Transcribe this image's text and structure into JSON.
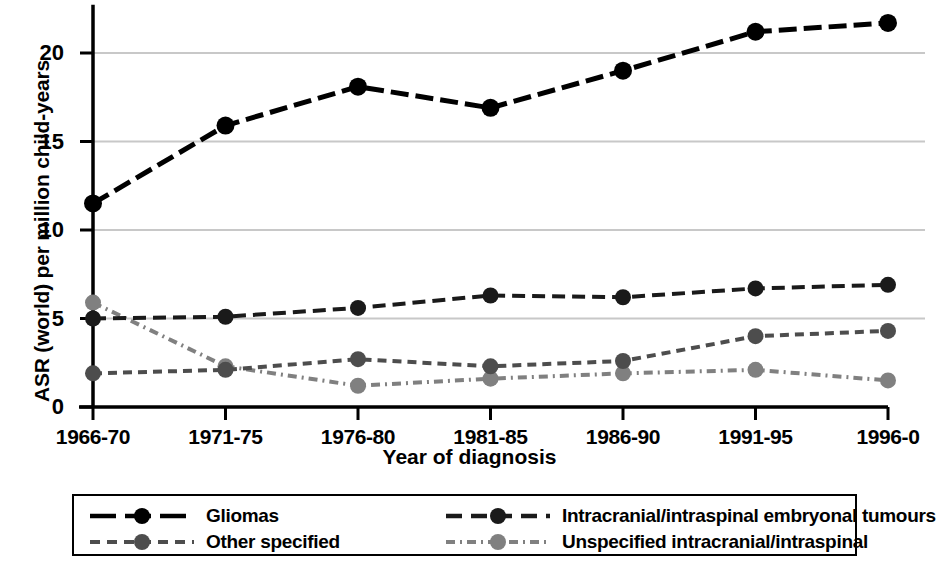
{
  "chart_data": {
    "type": "line",
    "title": "",
    "xlabel": "Year of diagnosis",
    "ylabel": "ASR (world) per million child-years",
    "categories": [
      "1966-70",
      "1971-75",
      "1976-80",
      "1981-85",
      "1986-90",
      "1991-95",
      "1996-0"
    ],
    "ylim": [
      0,
      22.5
    ],
    "yticks": [
      0,
      5,
      10,
      15,
      20
    ],
    "ytick_labels": [
      "0",
      "5",
      "10",
      "15",
      "20"
    ],
    "grid": "horizontal",
    "legend_position": "below-axes",
    "series": [
      {
        "name": "Gliomas",
        "values": [
          11.5,
          15.9,
          18.1,
          16.9,
          19.0,
          21.2,
          21.7
        ],
        "color": "#000000",
        "dash": "18,7",
        "marker": "circle",
        "marker_color": "#000000"
      },
      {
        "name": "Intracranial/intraspinal embryonal tumours",
        "values": [
          5.0,
          5.1,
          5.6,
          6.3,
          6.2,
          6.7,
          6.9
        ],
        "color": "#1a1a1a",
        "dash": "13,7",
        "marker": "circle",
        "marker_color": "#1a1a1a"
      },
      {
        "name": "Other specified",
        "values": [
          1.9,
          2.1,
          2.7,
          2.3,
          2.6,
          4.0,
          4.3
        ],
        "color": "#4d4d4d",
        "dash": "9,6",
        "marker": "circle",
        "marker_color": "#4d4d4d"
      },
      {
        "name": "Unspecified intracranial/intraspinal",
        "values": [
          5.9,
          2.3,
          1.2,
          1.6,
          1.9,
          2.1,
          1.5
        ],
        "color": "#808080",
        "dash": "9,5,2,5",
        "marker": "circle",
        "marker_color": "#808080"
      }
    ]
  },
  "axis": {
    "x_title": "Year of diagnosis",
    "y_title": "ASR (world) per million child-years"
  },
  "legend": {
    "entries": [
      {
        "label": "Gliomas"
      },
      {
        "label": "Intracranial/intraspinal embryonal tumours"
      },
      {
        "label": "Other specified"
      },
      {
        "label": "Unspecified intracranial/intraspinal"
      }
    ]
  },
  "colors": {
    "gliomas": "#000000",
    "embryonal": "#1a1a1a",
    "other_specified": "#4d4d4d",
    "unspecified": "#808080",
    "gridline": "#c8c8c8",
    "axis": "#000000",
    "background": "#ffffff"
  }
}
